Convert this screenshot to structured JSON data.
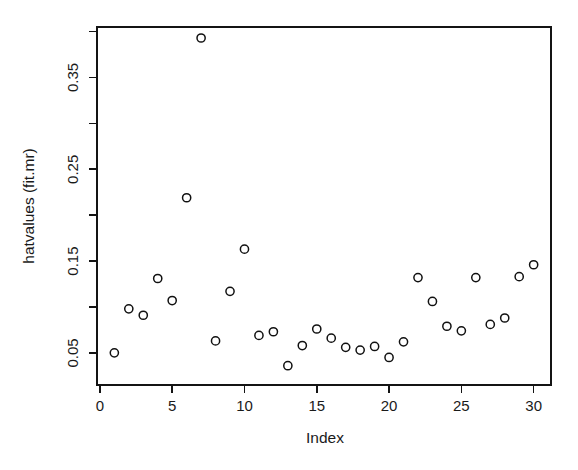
{
  "chart_data": {
    "type": "scatter",
    "title": "",
    "xlabel": "Index",
    "ylabel": "hatvalues (fit.mr)",
    "xlim": [
      -0.2,
      31.2
    ],
    "ylim": [
      0.015,
      0.405
    ],
    "grid": false,
    "legend": null,
    "marker": "open-circle",
    "marker_color": "#111111",
    "x": [
      1,
      2,
      3,
      4,
      5,
      6,
      7,
      8,
      9,
      10,
      11,
      12,
      13,
      14,
      15,
      16,
      17,
      18,
      19,
      20,
      21,
      22,
      23,
      24,
      25,
      26,
      27,
      28,
      29,
      30
    ],
    "y": [
      0.05,
      0.098,
      0.091,
      0.131,
      0.107,
      0.219,
      0.393,
      0.063,
      0.117,
      0.163,
      0.069,
      0.073,
      0.036,
      0.058,
      0.076,
      0.066,
      0.056,
      0.053,
      0.057,
      0.045,
      0.062,
      0.132,
      0.106,
      0.079,
      0.074,
      0.132,
      0.081,
      0.088,
      0.133,
      0.146
    ],
    "xticks": [
      0,
      5,
      10,
      15,
      20,
      25,
      30
    ],
    "xticklabels": [
      "0",
      "5",
      "10",
      "15",
      "20",
      "25",
      "30"
    ],
    "xminorticks": [],
    "yticks": [
      0.05,
      0.15,
      0.25,
      0.35
    ],
    "yticklabels": [
      "0.05",
      "0.15",
      "0.25",
      "0.35"
    ],
    "yminorticks": [
      0.1,
      0.2,
      0.3,
      0.4
    ],
    "axis_color": "#141414",
    "background": "#ffffff"
  },
  "axes": {
    "x_axis_name": "Index",
    "y_axis_name": "hatvalues (fit.mr)"
  }
}
